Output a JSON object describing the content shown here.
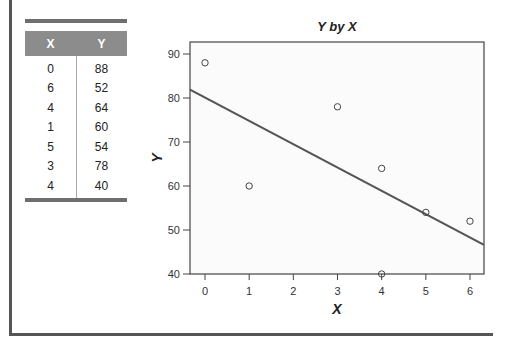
{
  "table": {
    "headers": [
      "X",
      "Y"
    ],
    "rows": [
      [
        "0",
        "88"
      ],
      [
        "6",
        "52"
      ],
      [
        "4",
        "64"
      ],
      [
        "1",
        "60"
      ],
      [
        "5",
        "54"
      ],
      [
        "3",
        "78"
      ],
      [
        "4",
        "40"
      ]
    ]
  },
  "chart_data": {
    "type": "scatter",
    "title": "Y by X",
    "xlabel": "X",
    "ylabel": "Y",
    "x": [
      0,
      6,
      4,
      1,
      5,
      3,
      4
    ],
    "y": [
      88,
      52,
      64,
      60,
      54,
      78,
      40
    ],
    "xlim": [
      -0.2,
      6.3
    ],
    "ylim": [
      40,
      92
    ],
    "xticks": [
      0,
      1,
      2,
      3,
      4,
      5,
      6
    ],
    "yticks": [
      40,
      50,
      60,
      70,
      80,
      90
    ],
    "grid": false,
    "legend": null,
    "fit_line": {
      "type": "linear",
      "intercept": 80.1,
      "slope": -5.3,
      "description": "least-squares regression line"
    }
  },
  "colors": {
    "table_header": "#8c8c8c",
    "table_rule": "#6f6f6f",
    "frame": "#555555",
    "fit_line": "#555555"
  }
}
